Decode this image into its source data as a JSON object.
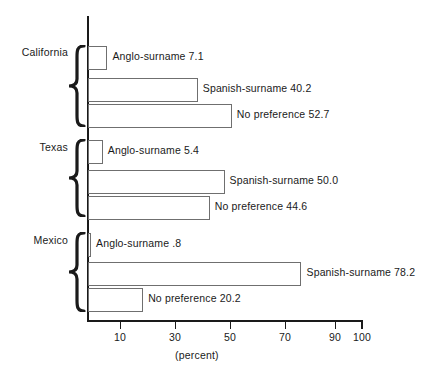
{
  "chart_data": {
    "type": "bar",
    "orientation": "horizontal",
    "title": "",
    "subtitle": "",
    "xlabel": "(percent)",
    "ylabel": "",
    "xlim": [
      0,
      100
    ],
    "xticks": [
      10,
      30,
      50,
      70,
      90,
      100
    ],
    "xtick_labels": [
      "10",
      "30",
      "50",
      "70",
      "90",
      "100"
    ],
    "grid": false,
    "legend": "none",
    "categories": [
      "California",
      "Texas",
      "Mexico"
    ],
    "sub_categories": [
      "Anglo-surname",
      "Spanish-surname",
      "No preference"
    ],
    "groups": [
      {
        "name": "California",
        "bars": [
          {
            "label": "Anglo-surname 7.1",
            "series": "Anglo-surname",
            "value": 7.1,
            "value_text": "7.1"
          },
          {
            "label": "Spanish-surname 40.2",
            "series": "Spanish-surname",
            "value": 40.2,
            "value_text": "40.2"
          },
          {
            "label": "No preference 52.7",
            "series": "No preference",
            "value": 52.7,
            "value_text": "52.7"
          }
        ]
      },
      {
        "name": "Texas",
        "bars": [
          {
            "label": "Anglo-surname 5.4",
            "series": "Anglo-surname",
            "value": 5.4,
            "value_text": "5.4"
          },
          {
            "label": "Spanish-surname 50.0",
            "series": "Spanish-surname",
            "value": 50.0,
            "value_text": "50.0"
          },
          {
            "label": "No preference 44.6",
            "series": "No preference",
            "value": 44.6,
            "value_text": "44.6"
          }
        ]
      },
      {
        "name": "Mexico",
        "bars": [
          {
            "label": "Anglo-surname .8",
            "series": "Anglo-surname",
            "value": 0.8,
            "value_text": ".8"
          },
          {
            "label": "Spanish-surname 78.2",
            "series": "Spanish-surname",
            "value": 78.2,
            "value_text": "78.2"
          },
          {
            "label": "No preference 20.2",
            "series": "No preference",
            "value": 20.2,
            "value_text": "20.2"
          }
        ]
      }
    ],
    "colors": {
      "axis": "#1a1a1a",
      "bar_fill": "#ffffff",
      "bar_stroke": "#6f6f6f",
      "text": "#1a1a1a",
      "background": "#ffffff"
    }
  }
}
